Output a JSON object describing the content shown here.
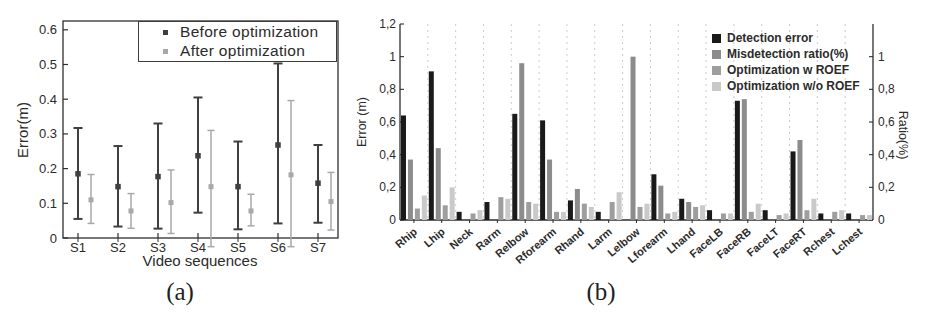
{
  "figure": {
    "caption_a": "(a)",
    "caption_b": "(b)"
  },
  "chart_data": [
    {
      "id": "a",
      "type": "errorbar",
      "title": "",
      "xlabel": "Video sequences",
      "ylabel": "Error(m)",
      "categories": [
        "S1",
        "S2",
        "S3",
        "S4",
        "S5",
        "S6",
        "S7"
      ],
      "yticks": [
        0,
        0.1,
        0.2,
        0.3,
        0.4,
        0.5,
        0.6
      ],
      "ytick_labels": [
        "0",
        "0.1",
        "0.2",
        "0.3",
        "0.4",
        "0.5",
        "0.6"
      ],
      "ylim": [
        0,
        0.625
      ],
      "grid": false,
      "legend_position": "top-right-boxed",
      "series": [
        {
          "name": "Before optimization",
          "color": "#3f3f3f",
          "mean": [
            0.185,
            0.148,
            0.177,
            0.237,
            0.148,
            0.268,
            0.158
          ],
          "lo": [
            0.055,
            0.033,
            0.027,
            0.073,
            0.025,
            0.042,
            0.044
          ],
          "hi": [
            0.317,
            0.265,
            0.33,
            0.405,
            0.278,
            0.503,
            0.268
          ]
        },
        {
          "name": "After optimization",
          "color": "#a8a8a8",
          "mean": [
            0.11,
            0.078,
            0.102,
            0.148,
            0.078,
            0.182,
            0.105
          ],
          "lo": [
            0.042,
            0.028,
            0.013,
            -0.025,
            0.035,
            -0.025,
            0.023
          ],
          "hi": [
            0.183,
            0.128,
            0.196,
            0.31,
            0.126,
            0.396,
            0.189
          ]
        }
      ]
    },
    {
      "id": "b",
      "type": "bar",
      "title": "",
      "ylabel_left": "Error (m)",
      "ylabel_right": "Ratio(%)",
      "ylim": [
        0,
        1.2
      ],
      "grid": "vertical-dashed",
      "legend_position": "top-right",
      "yticks_left": [
        0,
        0.2,
        0.4,
        0.6,
        0.8,
        1.0,
        1.2
      ],
      "ytick_labels_left": [
        "0",
        "0,2",
        "0,4",
        "0,6",
        "0,8",
        "1",
        "1,2"
      ],
      "yticks_right": [
        0,
        0.2,
        0.4,
        0.6,
        0.8,
        1.0
      ],
      "ytick_labels_right": [
        "0",
        "0,2",
        "0,4",
        "0,6",
        "0,8",
        "1"
      ],
      "categories": [
        "Rhip",
        "Lhip",
        "Neck",
        "Rarm",
        "Relbow",
        "Rforearm",
        "Rhand",
        "Larm",
        "Lelbow",
        "Lforearm",
        "Lhand",
        "FaceLB",
        "FaceRB",
        "FaceLT",
        "FaceRT",
        "Rchest",
        "Lchest"
      ],
      "series": [
        {
          "name": "Detection error",
          "color": "#1a1a1a",
          "values": [
            0.64,
            0.91,
            0.05,
            0.11,
            0.65,
            0.61,
            0.12,
            0.05,
            0,
            0.28,
            0.13,
            0.06,
            0.73,
            0.06,
            0.42,
            0.04,
            0.04
          ]
        },
        {
          "name": "Misdetection ratio(%)",
          "color": "#8c8c8c",
          "values": [
            0.37,
            0.44,
            0,
            0,
            0.96,
            0.37,
            0.19,
            0,
            1.0,
            0.21,
            0.11,
            0,
            0.74,
            0,
            0.49,
            0,
            0
          ]
        },
        {
          "name": "Optimization w ROEF",
          "color": "#9e9e9e",
          "values": [
            0.07,
            0.09,
            0.04,
            0.14,
            0.11,
            0.05,
            0.1,
            0.11,
            0.08,
            0.04,
            0.08,
            0.04,
            0.05,
            0.03,
            0.06,
            0.05,
            0.03
          ]
        },
        {
          "name": "Optimization w/o ROEF",
          "color": "#c9c9c9",
          "values": [
            0.15,
            0.2,
            0.06,
            0.13,
            0.1,
            0.05,
            0.08,
            0.17,
            0.1,
            0.05,
            0.09,
            0.04,
            0.1,
            0.04,
            0.13,
            0.06,
            0.03
          ]
        }
      ]
    }
  ]
}
